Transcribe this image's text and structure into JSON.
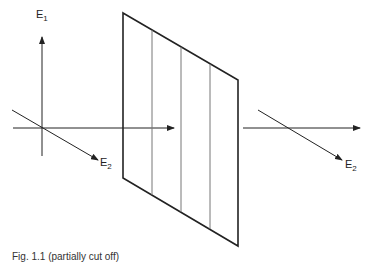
{
  "diagram": {
    "left_axes": {
      "vertical_label": "E",
      "vertical_subscript": "1",
      "diagonal_label": "E",
      "diagonal_subscript": "2"
    },
    "right_axes": {
      "diagonal_label": "E",
      "diagonal_subscript": "2"
    },
    "panel": {
      "corners": [
        [
          123,
          13
        ],
        [
          238,
          80
        ],
        [
          238,
          246
        ],
        [
          123,
          178
        ]
      ],
      "inner_line_count": 3
    },
    "colors": {
      "stroke": "#222222",
      "inner_lines": "#777777",
      "background": "#ffffff"
    }
  },
  "caption": "Fig. 1.1 (partially cut off)"
}
